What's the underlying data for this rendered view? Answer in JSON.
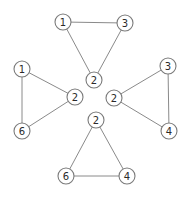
{
  "diagram": {
    "type": "graph-triangles",
    "node_radius": 8,
    "colors": {
      "edge": "#8a8a8a",
      "node_stroke": "#7a7a7a",
      "node_fill": "#ffffff",
      "label": "#2a2a2a"
    },
    "groups": [
      {
        "name": "top",
        "nodes": [
          {
            "id": "t1",
            "label": "1",
            "x": 63,
            "y": 22
          },
          {
            "id": "t3",
            "label": "3",
            "x": 125,
            "y": 23
          },
          {
            "id": "t2",
            "label": "2",
            "x": 94,
            "y": 80
          }
        ],
        "edges": [
          [
            "t1",
            "t3"
          ],
          [
            "t1",
            "t2"
          ],
          [
            "t3",
            "t2"
          ]
        ]
      },
      {
        "name": "left",
        "nodes": [
          {
            "id": "l1",
            "label": "1",
            "x": 22,
            "y": 69
          },
          {
            "id": "l2",
            "label": "2",
            "x": 75,
            "y": 97
          },
          {
            "id": "l6",
            "label": "6",
            "x": 22,
            "y": 131
          }
        ],
        "edges": [
          [
            "l1",
            "l2"
          ],
          [
            "l1",
            "l6"
          ],
          [
            "l2",
            "l6"
          ]
        ]
      },
      {
        "name": "right",
        "nodes": [
          {
            "id": "r3",
            "label": "3",
            "x": 168,
            "y": 66
          },
          {
            "id": "r2",
            "label": "2",
            "x": 114,
            "y": 98
          },
          {
            "id": "r4",
            "label": "4",
            "x": 169,
            "y": 131
          }
        ],
        "edges": [
          [
            "r3",
            "r2"
          ],
          [
            "r3",
            "r4"
          ],
          [
            "r2",
            "r4"
          ]
        ]
      },
      {
        "name": "bottom",
        "nodes": [
          {
            "id": "b2",
            "label": "2",
            "x": 96,
            "y": 120
          },
          {
            "id": "b6",
            "label": "6",
            "x": 66,
            "y": 176
          },
          {
            "id": "b4",
            "label": "4",
            "x": 127,
            "y": 176
          }
        ],
        "edges": [
          [
            "b2",
            "b6"
          ],
          [
            "b2",
            "b4"
          ],
          [
            "b6",
            "b4"
          ]
        ]
      }
    ]
  }
}
